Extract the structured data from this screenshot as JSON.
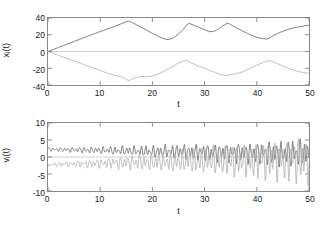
{
  "figure": {
    "background": "#ffffff",
    "trace_colors": {
      "dark": "#6b6b6b",
      "light": "#b3b3b3"
    }
  },
  "chart_data": [
    {
      "type": "line",
      "panel": "top",
      "title": "",
      "xlabel": "t",
      "ylabel": "x_i(t)",
      "ylabel_base": "x",
      "ylabel_sub": "i",
      "ylabel_tail": "(t)",
      "xlim": [
        0,
        50
      ],
      "ylim": [
        -40,
        40
      ],
      "xticks": [
        0,
        10,
        20,
        30,
        40,
        50
      ],
      "yticks": [
        40,
        20,
        0,
        -20,
        -40
      ],
      "grid": false,
      "legend": "none",
      "series": [
        {
          "name": "x_upper",
          "color": "#6b6b6b",
          "x": [
            0,
            1,
            2,
            3,
            4,
            5,
            6,
            7,
            8,
            9,
            10,
            11,
            12,
            13,
            14,
            15,
            15.5,
            16,
            17,
            18,
            19,
            20,
            21,
            22,
            23,
            24,
            25,
            26,
            26.5,
            27,
            28,
            29,
            30,
            31,
            32,
            33,
            34,
            34.5,
            35,
            36,
            37,
            38,
            39,
            40,
            41,
            42,
            42.5,
            43,
            44,
            45,
            46,
            47,
            48,
            49,
            50
          ],
          "y": [
            0,
            2.4,
            4.8,
            7.2,
            9.6,
            12,
            14.4,
            16.8,
            19.2,
            21.5,
            23.8,
            26.1,
            28.3,
            30.6,
            33.0,
            35.6,
            36.2,
            35.0,
            31.8,
            28.4,
            25.0,
            21.8,
            18.6,
            15.6,
            14.2,
            16.0,
            21.0,
            27.0,
            31.2,
            33.6,
            31.2,
            28.6,
            26.0,
            23.5,
            24.6,
            28.4,
            32.6,
            33.8,
            32.0,
            28.6,
            25.4,
            22.2,
            19.4,
            17.0,
            15.4,
            15.0,
            16.2,
            18.6,
            21.6,
            24.2,
            26.4,
            28.0,
            29.4,
            30.4,
            31.6
          ]
        },
        {
          "name": "x_lower",
          "color": "#b3b3b3",
          "x": [
            0,
            1,
            2,
            3,
            4,
            5,
            6,
            7,
            8,
            9,
            10,
            11,
            12,
            13,
            14,
            15,
            15.5,
            16,
            17,
            18,
            19,
            20,
            21,
            22,
            23,
            24,
            25,
            26,
            26.5,
            27,
            28,
            29,
            30,
            31,
            32,
            33,
            34,
            34.5,
            35,
            36,
            37,
            38,
            39,
            40,
            41,
            42,
            42.5,
            43,
            44,
            45,
            46,
            47,
            48,
            49,
            50
          ],
          "y": [
            0,
            -2.3,
            -4.6,
            -6.9,
            -9.2,
            -11.4,
            -13.6,
            -16.0,
            -18.4,
            -20.6,
            -22.8,
            -25.0,
            -27.2,
            -28.6,
            -29.8,
            -33.6,
            -34.8,
            -33.2,
            -30.6,
            -29.8,
            -30.2,
            -29.4,
            -27.0,
            -24.2,
            -21.0,
            -17.4,
            -13.8,
            -11.2,
            -10.6,
            -12.4,
            -15.2,
            -18.0,
            -20.2,
            -22.6,
            -25.0,
            -27.4,
            -28.6,
            -28.4,
            -27.6,
            -26.6,
            -25.0,
            -22.4,
            -19.4,
            -16.4,
            -13.6,
            -11.4,
            -10.8,
            -12.0,
            -14.6,
            -17.4,
            -20.0,
            -22.2,
            -24.0,
            -25.2,
            -26.0
          ]
        }
      ]
    },
    {
      "type": "line",
      "panel": "bottom",
      "title": "",
      "xlabel": "t",
      "ylabel": "v_i(t)",
      "ylabel_base": "v",
      "ylabel_sub": "i",
      "ylabel_tail": "(t)",
      "xlim": [
        0,
        50
      ],
      "ylim": [
        -10,
        10
      ],
      "xticks": [
        0,
        10,
        20,
        30,
        40,
        50
      ],
      "yticks": [
        10,
        5,
        0,
        -5,
        -10
      ],
      "grid": false,
      "legend": "none",
      "description": "Two velocity traces oscillating about +2.3 and -2.3 early on, with oscillation amplitude growing from about 0.4 to about 4.5 by t=50; the light trace develops the largest excursions (about -8 near t=16 and +6.5 near t=25).",
      "series": [
        {
          "name": "v_dark",
          "color": "#6b6b6b",
          "mean": 2.3,
          "mean_decay_to": 1.0,
          "osc_freq": 1.35,
          "osc_phase": 0.0,
          "amp_start": 0.35,
          "amp_end": 2.6
        },
        {
          "name": "v_light",
          "color": "#b3b3b3",
          "mean": -2.3,
          "mean_decay_to": -0.6,
          "osc_freq": 1.35,
          "osc_phase": 3.14159,
          "amp_start": 0.35,
          "amp_end": 4.3
        }
      ]
    }
  ]
}
